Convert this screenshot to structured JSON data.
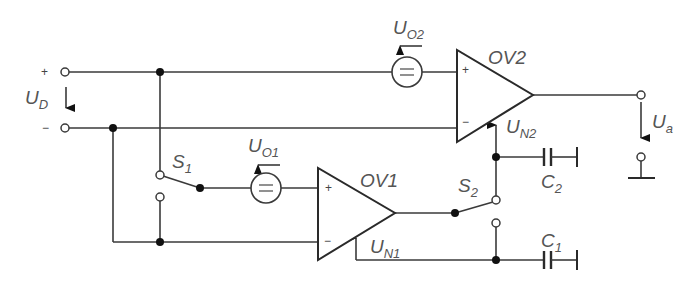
{
  "diagram": {
    "type": "circuit-schematic",
    "inputs": {
      "plus_sign": "+",
      "minus_sign": "−",
      "voltage_label": {
        "main": "U",
        "sub": "D"
      }
    },
    "output": {
      "voltage_label": {
        "main": "U",
        "sub": "a"
      }
    },
    "opamps": [
      {
        "id": "OV1",
        "label": "OV1",
        "plus_sign": "+",
        "minus_sign": "−",
        "null_input_label": {
          "main": "U",
          "sub": "N1"
        }
      },
      {
        "id": "OV2",
        "label": "OV2",
        "plus_sign": "+",
        "minus_sign": "−",
        "null_input_label": {
          "main": "U",
          "sub": "N2"
        }
      }
    ],
    "offset_sources": [
      {
        "id": "UO1",
        "label": {
          "main": "U",
          "sub": "O1"
        },
        "symbol": "="
      },
      {
        "id": "UO2",
        "label": {
          "main": "U",
          "sub": "O2"
        },
        "symbol": "="
      }
    ],
    "switches": [
      {
        "id": "S1",
        "label": {
          "main": "S",
          "sub": "1"
        }
      },
      {
        "id": "S2",
        "label": {
          "main": "S",
          "sub": "2"
        }
      }
    ],
    "capacitors": [
      {
        "id": "C1",
        "label": {
          "main": "C",
          "sub": "1"
        }
      },
      {
        "id": "C2",
        "label": {
          "main": "C",
          "sub": "2"
        }
      }
    ]
  }
}
